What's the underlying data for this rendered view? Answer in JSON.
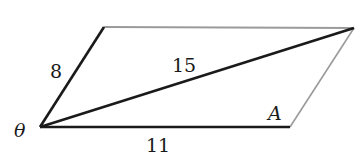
{
  "diagram": {
    "type": "parallelogram",
    "vertices": {
      "bottom_left": [
        40,
        127
      ],
      "top_left": [
        104,
        27
      ],
      "top_right": [
        354,
        28
      ],
      "bottom_right": [
        290,
        127
      ]
    },
    "labels": {
      "left_side": "8",
      "diagonal": "15",
      "bottom_side": "11",
      "angle_theta": "θ",
      "angle_a": "A"
    },
    "colors": {
      "solid_line": "#1a1a1a",
      "faint_line": "#9a9a9a",
      "background": "#ffffff"
    }
  }
}
